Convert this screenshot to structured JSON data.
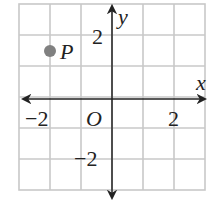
{
  "diagram": {
    "type": "coordinate-grid",
    "grid": {
      "columns": 6,
      "rows": 6,
      "x_range": [
        -3,
        3
      ],
      "y_range": [
        -3,
        3
      ],
      "unit": 1,
      "grid_color": "#c8c8c8"
    },
    "axes": {
      "x_label": "x",
      "y_label": "y",
      "origin_label": "O",
      "axis_color": "#222222"
    },
    "tick_labels": {
      "x_neg": "−2",
      "x_pos": "2",
      "y_pos": "2",
      "y_neg": "−2"
    },
    "points": [
      {
        "label": "P",
        "x": -2,
        "y": 1.5,
        "color": "#808080"
      }
    ]
  }
}
